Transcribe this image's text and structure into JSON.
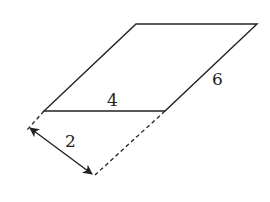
{
  "figure": {
    "shape": "parallelogram",
    "labels": {
      "base": "4",
      "side": "6",
      "height": "2"
    },
    "colors": {
      "stroke": "#222222",
      "background": "#ffffff"
    }
  }
}
